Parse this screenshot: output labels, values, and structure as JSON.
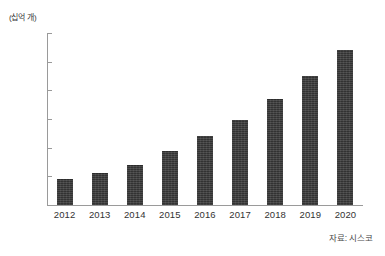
{
  "chart_data": {
    "type": "bar",
    "title": "",
    "subtitle": "",
    "xlabel": "",
    "ylabel": "(십억 개)",
    "unit_caption": "(십억 개)",
    "categories": [
      "2012",
      "2013",
      "2014",
      "2015",
      "2016",
      "2017",
      "2018",
      "2019",
      "2020"
    ],
    "values": [
      9,
      11,
      14,
      19,
      24,
      29.5,
      37,
      45,
      54
    ],
    "series": [
      {
        "name": "연결 기기 수",
        "values": [
          9,
          11,
          14,
          19,
          24,
          29.5,
          37,
          45,
          54
        ]
      }
    ],
    "ylim": [
      0,
      60
    ],
    "ytick_values": [
      60,
      50,
      40,
      30,
      20,
      10,
      0
    ],
    "ytick_labels": [
      "60",
      "50",
      "40",
      "30",
      "20",
      "10",
      "0"
    ],
    "ytick_step": 10,
    "grid": false,
    "legend": null,
    "legend_position": "none",
    "bar_color": "#3c3c3c",
    "axis_color": "#9a9a9a",
    "background_color": "#ffffff",
    "annotations": []
  },
  "source": {
    "text": "자료: 시스코"
  }
}
